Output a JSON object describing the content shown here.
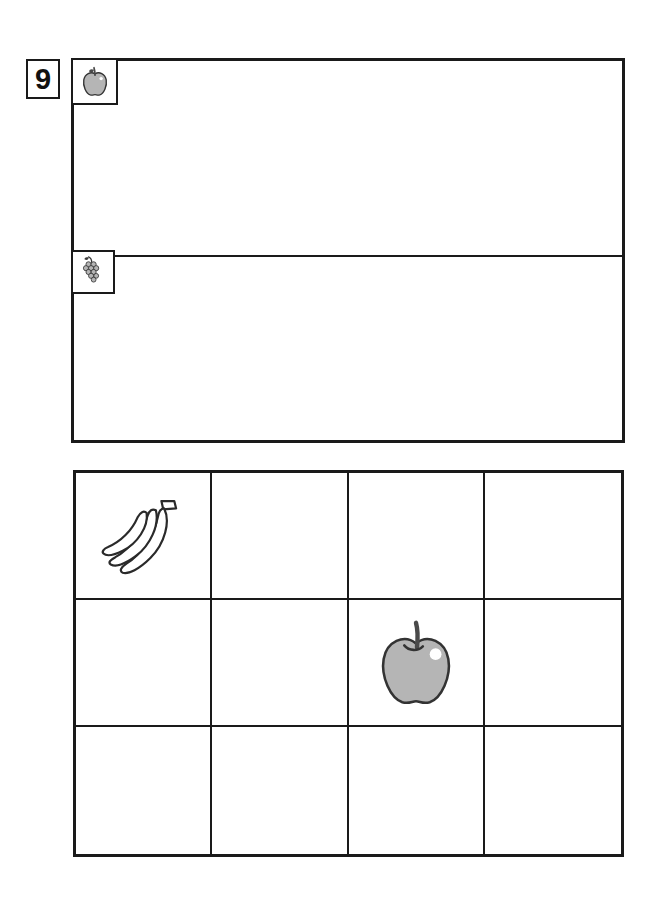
{
  "page": {
    "type": "worksheet",
    "background_color": "#ffffff",
    "line_color": "#1a1a1a",
    "fruit_gray": "#b5b5b5",
    "stem_color": "#4a4a4a"
  },
  "exercise": {
    "number": "9",
    "number_label": "exercise-number-9"
  },
  "sort_table": {
    "title": "",
    "columns": 1,
    "rows": [
      {
        "index": 0,
        "category_icon": "apple-icon",
        "category_name": "apple",
        "content": "",
        "items": []
      },
      {
        "index": 1,
        "category_icon": "grapes-icon",
        "category_name": "grapes",
        "content": "",
        "items": []
      }
    ]
  },
  "picture_grid": {
    "columns": 4,
    "rows": 3,
    "cells": [
      {
        "row": 0,
        "col": 0,
        "icon": "banana-icon",
        "label": "banana"
      },
      {
        "row": 0,
        "col": 1,
        "icon": "",
        "label": ""
      },
      {
        "row": 0,
        "col": 2,
        "icon": "",
        "label": ""
      },
      {
        "row": 0,
        "col": 3,
        "icon": "",
        "label": ""
      },
      {
        "row": 1,
        "col": 0,
        "icon": "",
        "label": ""
      },
      {
        "row": 1,
        "col": 1,
        "icon": "",
        "label": ""
      },
      {
        "row": 1,
        "col": 2,
        "icon": "apple-icon",
        "label": "apple"
      },
      {
        "row": 1,
        "col": 3,
        "icon": "",
        "label": ""
      },
      {
        "row": 2,
        "col": 0,
        "icon": "",
        "label": ""
      },
      {
        "row": 2,
        "col": 1,
        "icon": "",
        "label": ""
      },
      {
        "row": 2,
        "col": 2,
        "icon": "",
        "label": ""
      },
      {
        "row": 2,
        "col": 3,
        "icon": "",
        "label": ""
      }
    ]
  },
  "icons": {
    "apple": "apple-icon",
    "grapes": "grapes-icon",
    "banana": "banana-icon"
  }
}
